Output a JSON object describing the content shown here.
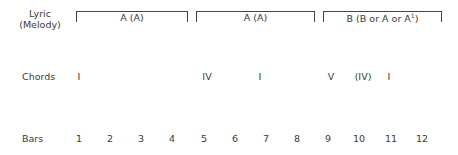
{
  "labels": {
    "lyric": "Lyric",
    "melody": "(Melody)",
    "chords": "Chords",
    "bars": "Bars"
  },
  "sections": [
    {
      "label": "A (A)"
    },
    {
      "label": "A (A)"
    },
    {
      "label": "B (B or A or A",
      "sup": "1",
      "close": ")"
    }
  ],
  "chords": [
    {
      "bar": 1,
      "symbol": "I"
    },
    {
      "bar": 5,
      "symbol": "IV"
    },
    {
      "bar": 7,
      "symbol": "I"
    },
    {
      "bar": 9,
      "symbol": "V"
    },
    {
      "bar": 10,
      "symbol": "(IV)"
    },
    {
      "bar": 11,
      "symbol": "I"
    }
  ],
  "bars": [
    "1",
    "2",
    "3",
    "4",
    "5",
    "6",
    "7",
    "8",
    "9",
    "10",
    "11",
    "12"
  ]
}
